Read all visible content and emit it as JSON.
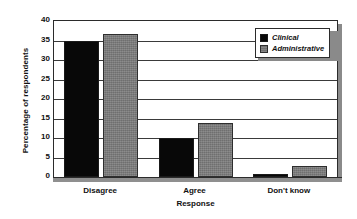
{
  "chart_data": {
    "type": "bar",
    "title": "",
    "subtitle": "",
    "xlabel": "Response",
    "ylabel": "Percentage of respondents",
    "categories": [
      "Disagree",
      "Agree",
      "Don't know"
    ],
    "series": [
      {
        "name": "Clinical",
        "color": "#080808",
        "values": [
          35.0,
          10.0,
          0.7
        ]
      },
      {
        "name": "Administrative",
        "color": "#7c7c7c",
        "values": [
          36.7,
          13.8,
          2.8
        ]
      }
    ],
    "ylim": [
      0,
      40
    ],
    "yticks": [
      0,
      5,
      10,
      15,
      20,
      25,
      30,
      35,
      40
    ],
    "ytick_labels": [
      "0",
      "5",
      "10",
      "15",
      "20",
      "25",
      "30",
      "35",
      "40"
    ],
    "grid": "horizontal",
    "legend_position": "top-right",
    "annotations": []
  },
  "legend": {
    "items": [
      {
        "label": "Clinical",
        "swatch": "black-square-icon"
      },
      {
        "label": "Administrative",
        "swatch": "gray-square-icon"
      }
    ]
  }
}
